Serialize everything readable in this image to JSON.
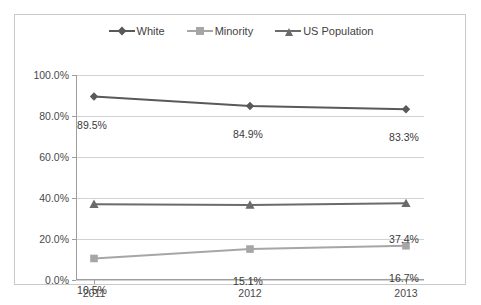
{
  "chart_data": {
    "type": "line",
    "title": "",
    "subtitle": "",
    "xlabel": "",
    "ylabel": "",
    "categories": [
      "2011",
      "2012",
      "2013"
    ],
    "ylim": [
      0,
      100
    ],
    "ytick_labels": [
      "0.0%",
      "20.0%",
      "40.0%",
      "60.0%",
      "80.0%",
      "100.0%"
    ],
    "ytick_values": [
      0,
      20,
      40,
      60,
      80,
      100
    ],
    "grid": true,
    "legend_position": "top-center",
    "series": [
      {
        "name": "White",
        "values": [
          89.5,
          84.9,
          83.3
        ],
        "labels": [
          "89.5%",
          "84.9%",
          "83.3%"
        ],
        "color": "#595959",
        "marker": "diamond"
      },
      {
        "name": "Minority",
        "values": [
          10.5,
          15.1,
          16.7
        ],
        "labels": [
          "10.5%",
          "15.1%",
          "16.7%"
        ],
        "color": "#a6a6a6",
        "marker": "square"
      },
      {
        "name": "US Population",
        "values": [
          37.0,
          36.6,
          37.4
        ],
        "labels": [
          "",
          "",
          "37.4%"
        ],
        "color": "#6b6b6b",
        "marker": "triangle"
      }
    ]
  },
  "colors": {
    "frame": "#c9c9c9",
    "axis": "#9e9e9e",
    "gridline": "#d2d2d2",
    "text": "#3a3a3a"
  }
}
